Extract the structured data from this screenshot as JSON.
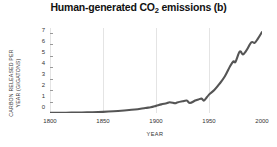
{
  "chart_data": {
    "type": "line",
    "title": "Human-generated CO2 emissions (b)",
    "title_prefix": "Human-generated CO",
    "title_subscript": "2",
    "title_suffix": " emissions (b)",
    "xlabel": "YEAR",
    "ylabel_line1": "CARBON RELEASED PER",
    "ylabel_line2": "YEAR (GIGATONS)",
    "xlim": [
      1800,
      2000
    ],
    "ylim": [
      0,
      7.4
    ],
    "xticks": [
      1800,
      1850,
      1900,
      1950,
      2000
    ],
    "xtick_labels": [
      "1800",
      "1850",
      "1900",
      "1950",
      "2000"
    ],
    "yticks": [
      0,
      1,
      2,
      3,
      4,
      5,
      6,
      7
    ],
    "ytick_labels": [
      "0",
      "1",
      "2",
      "3",
      "4",
      "5",
      "6",
      "7"
    ],
    "grid": "vertical-only-faint",
    "legend": "none",
    "line_color": "#555555",
    "line_width": 2.1,
    "series": [
      {
        "name": "Carbon released per year",
        "x": [
          1800,
          1810,
          1820,
          1830,
          1840,
          1850,
          1860,
          1870,
          1880,
          1890,
          1895,
          1900,
          1905,
          1910,
          1913,
          1918,
          1920,
          1925,
          1929,
          1932,
          1937,
          1940,
          1943,
          1945,
          1947,
          1950,
          1955,
          1960,
          1965,
          1970,
          1973,
          1975,
          1979,
          1982,
          1985,
          1990,
          1993,
          1996,
          2000
        ],
        "values": [
          0.01,
          0.02,
          0.03,
          0.05,
          0.07,
          0.1,
          0.15,
          0.22,
          0.3,
          0.44,
          0.5,
          0.62,
          0.75,
          0.85,
          0.94,
          0.85,
          0.92,
          1.02,
          1.08,
          0.87,
          1.08,
          1.18,
          1.25,
          1.08,
          1.25,
          1.6,
          2.0,
          2.55,
          3.2,
          4.1,
          4.5,
          4.45,
          5.35,
          5.1,
          5.4,
          6.15,
          6.1,
          6.45,
          7.05
        ]
      }
    ]
  }
}
